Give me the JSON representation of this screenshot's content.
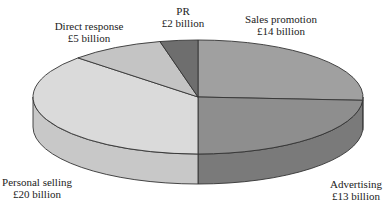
{
  "chart_data": {
    "type": "pie",
    "title": "",
    "unit": "£ billion",
    "style": "3d",
    "categories": [
      "Sales promotion",
      "Advertising",
      "Personal selling",
      "Direct response",
      "PR"
    ],
    "values": [
      14,
      13,
      20,
      5,
      2
    ],
    "value_labels": [
      "£14 billion",
      "£13 billion",
      "£20 billion",
      "£5 billion",
      "£2 billion"
    ],
    "colors": [
      "#a0a0a0",
      "#8e8e8e",
      "#dadada",
      "#c4c4c4",
      "#6e6e6e"
    ],
    "side_colors": [
      "#8a8a8a",
      "#7a7a7a",
      "#c8c8c8",
      "#b0b0b0",
      "#5c5c5c"
    ],
    "legend": "none",
    "grid": false
  },
  "labels": {
    "sales": {
      "name": "Sales promotion",
      "value": "£14 billion"
    },
    "advertising": {
      "name": "Advertising",
      "value": "£13 billion"
    },
    "personal": {
      "name": "Personal selling",
      "value": "£20 billion"
    },
    "direct": {
      "name": "Direct response",
      "value": "£5 billion"
    },
    "pr": {
      "name": "PR",
      "value": "£2 billion"
    }
  }
}
